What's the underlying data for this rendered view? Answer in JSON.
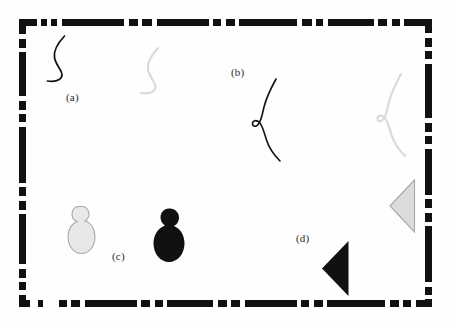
{
  "figure": {
    "width": 451,
    "height": 327,
    "background_color": "#fefefe",
    "frame": {
      "name": "dashed-border-frame",
      "color": "#111111",
      "stroke_width": 7,
      "style": "irregular-dashed",
      "x": 19,
      "y": 19,
      "width": 413,
      "height": 288
    },
    "colors": {
      "ink_black": "#111111",
      "faded_gray": "#d9d9d9",
      "gray_outline": "#a8a8a8",
      "label_text": "#2b2b2b"
    },
    "panels": [
      {
        "id": "a",
        "label": "(a)",
        "shape": "s-curve",
        "description": "open S-shaped curve",
        "variants": [
          {
            "tone": "black",
            "color": "#111111"
          },
          {
            "tone": "faded",
            "color": "#d9d9d9"
          }
        ]
      },
      {
        "id": "b",
        "label": "(b)",
        "shape": "looped-curve",
        "description": "wavy curve with a small loop at mid-left",
        "variants": [
          {
            "tone": "black",
            "color": "#111111"
          },
          {
            "tone": "faded",
            "color": "#d9d9d9"
          }
        ]
      },
      {
        "id": "c",
        "label": "(c)",
        "shape": "budding-cell",
        "description": "large oval with small bud on top",
        "variants": [
          {
            "tone": "faded",
            "color": "#e8e8e8"
          },
          {
            "tone": "black",
            "color": "#111111"
          }
        ]
      },
      {
        "id": "d",
        "label": "(d)",
        "shape": "left-pointing-triangle",
        "description": "solid triangle pointing left",
        "variants": [
          {
            "tone": "black",
            "color": "#111111"
          },
          {
            "tone": "faded",
            "color": "#dcdcdc"
          }
        ]
      }
    ]
  }
}
